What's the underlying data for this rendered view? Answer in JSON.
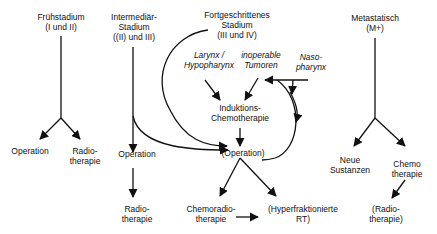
{
  "diagram": {
    "type": "flowchart",
    "language": "de",
    "stages": [
      {
        "id": "early",
        "title_l1": "Frühstadium",
        "title_l2": "(I und II)"
      },
      {
        "id": "intermediate",
        "title_l1": "Intermediär-",
        "title_l2": "Stadium",
        "title_l3": "((II) und III)"
      },
      {
        "id": "advanced",
        "title_l1": "Fortgeschrittenes",
        "title_l2": "Stadium",
        "title_l3": "(III und IV)"
      },
      {
        "id": "metastatic",
        "title_l1": "Metastatisch",
        "title_l2": "(M+)"
      }
    ],
    "subgroups": [
      {
        "id": "larynx",
        "l1": "Larynx /",
        "l2": "Hypopharynx"
      },
      {
        "id": "inoperable",
        "l1": "inoperable",
        "l2": "Tumoren"
      },
      {
        "id": "naso",
        "l1": "Naso-",
        "l2": "pharynx"
      }
    ],
    "nodes": {
      "early_op": "Operation",
      "early_rt_l1": "Radio-",
      "early_rt_l2": "therapie",
      "inter_op": "Operation",
      "inter_rt_l1": "Radio-",
      "inter_rt_l2": "therapie",
      "induction_l1": "Induktions-",
      "induction_l2": "Chemotherapie",
      "operation_opt": "(Operation)",
      "chemorad_l1": "Chemoradio-",
      "chemorad_l2": "therapie",
      "hyperfrac_l1": "(Hyperfraktionierte",
      "hyperfrac_l2": "RT)",
      "new_subst_l1": "Neue",
      "new_subst_l2": "Sustanzen",
      "chemo_l1": "Chemo",
      "chemo_l2": "therapie",
      "met_rt_l1": "(Radio-",
      "met_rt_l2": "therapie)"
    },
    "edges": [
      [
        "Frühstadium",
        "Operation"
      ],
      [
        "Frühstadium",
        "Radiotherapie"
      ],
      [
        "Intermediär-Stadium",
        "Operation"
      ],
      [
        "Operation",
        "Radiotherapie"
      ],
      [
        "Intermediär-Stadium",
        "(Operation)"
      ],
      [
        "Fortgeschrittenes Stadium",
        "(Operation)"
      ],
      [
        "Larynx / Hypopharynx",
        "Induktions-Chemotherapie"
      ],
      [
        "inoperable Tumoren",
        "Induktions-Chemotherapie"
      ],
      [
        "Naso-pharynx",
        "Induktions-Chemotherapie"
      ],
      [
        "Naso-pharynx",
        "(Operation)"
      ],
      [
        "Induktions-Chemotherapie",
        "(Operation)"
      ],
      [
        "(Operation)",
        "Chemoradiotherapie"
      ],
      [
        "(Operation)",
        "(Hyperfraktionierte RT)"
      ],
      [
        "Chemoradiotherapie",
        "(Hyperfraktionierte RT)"
      ],
      [
        "Metastatisch",
        "Neue Sustanzen"
      ],
      [
        "Metastatisch",
        "Chemotherapie"
      ],
      [
        "Chemotherapie",
        "(Radiotherapie)"
      ]
    ],
    "colors": {
      "line": "#111111",
      "background": "#ffffff"
    }
  }
}
